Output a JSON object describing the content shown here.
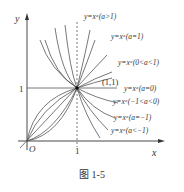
{
  "figure": {
    "caption": "图 1-5",
    "axes": {
      "x_label": "x",
      "y_label": "y",
      "origin_label": "O",
      "x_tick": "1",
      "y_tick": "1"
    },
    "point_label": "(1,1)",
    "curve_labels": [
      "y=xᵃ(a>1)",
      "y=xᵃ(a=1)",
      "y=xᵃ(0<a<1)",
      "y=xᵃ(a=0)",
      "y=xᵃ(−1<a<0)",
      "y=xᵃ(a=−1)",
      "y=xᵃ(a<−1)"
    ],
    "colors": {
      "ink": "#333333",
      "background": "#ffffff"
    }
  }
}
